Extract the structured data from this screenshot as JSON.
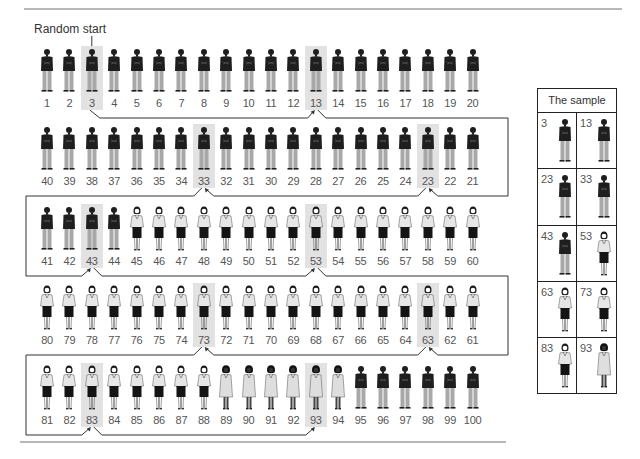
{
  "diagram": {
    "title_label": "Random start",
    "population_size": 100,
    "interval": 10,
    "random_start": 3,
    "rows": [
      {
        "numbers": [
          1,
          2,
          3,
          4,
          5,
          6,
          7,
          8,
          9,
          10,
          11,
          12,
          13,
          14,
          15,
          16,
          17,
          18,
          19,
          20
        ],
        "direction": "ltr"
      },
      {
        "numbers": [
          40,
          39,
          38,
          37,
          36,
          35,
          34,
          33,
          32,
          31,
          30,
          29,
          28,
          27,
          26,
          25,
          24,
          23,
          22,
          21
        ],
        "direction": "rtl"
      },
      {
        "numbers": [
          41,
          42,
          43,
          44,
          45,
          46,
          47,
          48,
          49,
          50,
          51,
          52,
          53,
          54,
          55,
          56,
          57,
          58,
          59,
          60
        ],
        "direction": "ltr"
      },
      {
        "numbers": [
          80,
          79,
          78,
          77,
          76,
          75,
          74,
          73,
          72,
          71,
          70,
          69,
          68,
          67,
          66,
          65,
          64,
          63,
          62,
          61
        ],
        "direction": "rtl"
      },
      {
        "numbers": [
          81,
          82,
          83,
          84,
          85,
          86,
          87,
          88,
          89,
          90,
          91,
          92,
          93,
          94,
          95,
          96,
          97,
          98,
          99,
          100
        ],
        "direction": "ltr"
      }
    ],
    "figure_types": [
      {
        "range": [
          1,
          44
        ],
        "type": "man"
      },
      {
        "range": [
          45,
          88
        ],
        "type": "woman-skirt"
      },
      {
        "range": [
          89,
          94
        ],
        "type": "woman-dress"
      },
      {
        "range": [
          95,
          100
        ],
        "type": "man"
      }
    ],
    "highlighted": [
      3,
      13,
      23,
      33,
      43,
      53,
      63,
      73,
      83,
      93
    ]
  },
  "sample_table": {
    "header": "The sample",
    "entries": [
      {
        "number": "3",
        "type": "man"
      },
      {
        "number": "13",
        "type": "man"
      },
      {
        "number": "23",
        "type": "man"
      },
      {
        "number": "33",
        "type": "man"
      },
      {
        "number": "43",
        "type": "man"
      },
      {
        "number": "53",
        "type": "woman-skirt"
      },
      {
        "number": "63",
        "type": "woman-skirt"
      },
      {
        "number": "73",
        "type": "woman-skirt"
      },
      {
        "number": "83",
        "type": "woman-skirt"
      },
      {
        "number": "93",
        "type": "woman-dress"
      }
    ]
  },
  "colors": {
    "jacket": "#1e1e1e",
    "pants": "#a8a8a8",
    "blouse": "#e6e6e6",
    "skirt": "#141414",
    "dress": "#dedede",
    "highlight": "#e2e2e2",
    "line": "#333333",
    "rule": "#b8b8b8"
  }
}
